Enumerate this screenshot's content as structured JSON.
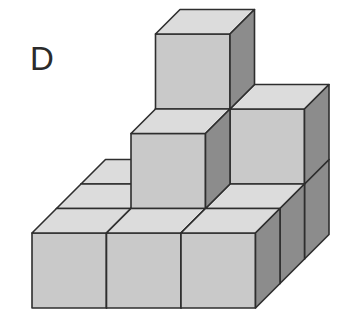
{
  "figure": {
    "label": "D",
    "cube_count": 12,
    "colors": {
      "front": "#c9c9c9",
      "top": "#dcdcdc",
      "side": "#8c8c8c",
      "edge": "#2e2e2e"
    },
    "cubes": [
      {
        "col": 0,
        "depth": 2,
        "level": 0
      },
      {
        "col": 1,
        "depth": 2,
        "level": 0
      },
      {
        "col": 2,
        "depth": 2,
        "level": 0
      },
      {
        "col": 1,
        "depth": 2,
        "level": 1
      },
      {
        "col": 2,
        "depth": 2,
        "level": 1
      },
      {
        "col": 1,
        "depth": 2,
        "level": 2
      },
      {
        "col": 0,
        "depth": 1,
        "level": 0
      },
      {
        "col": 1,
        "depth": 1,
        "level": 0
      },
      {
        "col": 2,
        "depth": 1,
        "level": 0
      },
      {
        "col": 1,
        "depth": 1,
        "level": 1
      },
      {
        "col": 0,
        "depth": 0,
        "level": 0
      },
      {
        "col": 1,
        "depth": 0,
        "level": 0
      },
      {
        "col": 2,
        "depth": 0,
        "level": 0
      }
    ]
  }
}
